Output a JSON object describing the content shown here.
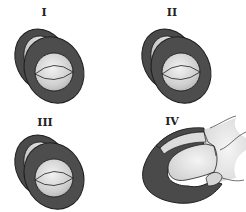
{
  "figure": {
    "panels": [
      {
        "id": "I",
        "label": "I"
      },
      {
        "id": "II",
        "label": "II"
      },
      {
        "id": "III",
        "label": "III"
      },
      {
        "id": "IV",
        "label": "IV"
      }
    ],
    "colors": {
      "ring_dark": "#4a4a4a",
      "outline": "#1e1e1e",
      "inner_light": "#d8d8d8",
      "highlight": "#ececec",
      "background": "#ffffff"
    }
  }
}
